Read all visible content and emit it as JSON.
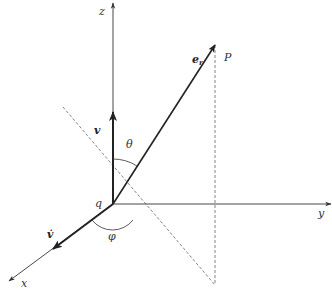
{
  "diagram": {
    "origin": {
      "label": "q",
      "x": 113,
      "y": 204
    },
    "axes": [
      {
        "name": "z",
        "label": "z",
        "from": [
          113,
          204
        ],
        "to": [
          113,
          3
        ]
      },
      {
        "name": "y",
        "label": "y",
        "from": [
          113,
          204
        ],
        "to": [
          331,
          204
        ]
      },
      {
        "name": "x",
        "label": "x",
        "from": [
          113,
          204
        ],
        "to": [
          9,
          281
        ]
      }
    ],
    "vectors": [
      {
        "name": "velocity",
        "label": "v",
        "from": [
          113,
          204
        ],
        "to": [
          113,
          112
        ]
      },
      {
        "name": "acceleration",
        "label": "v̇",
        "from": [
          113,
          204
        ],
        "to": [
          53,
          249
        ]
      },
      {
        "name": "radial-unit",
        "label": "e",
        "subscript": "r",
        "from": [
          113,
          204
        ],
        "to": [
          215,
          45
        ]
      }
    ],
    "point": {
      "label": "P",
      "x": 215,
      "y": 45
    },
    "angles": [
      {
        "name": "theta",
        "label": "θ"
      },
      {
        "name": "phi",
        "label": "φ"
      }
    ],
    "labels": {
      "z": "z",
      "y": "y",
      "x": "x",
      "q": "q",
      "v": "v",
      "v_dot": "v̇",
      "e": "e",
      "e_sub": "r",
      "P": "P",
      "theta": "θ",
      "phi": "φ"
    },
    "colors": {
      "line": "#333333",
      "dashed": "#666666",
      "text": "#333333"
    }
  }
}
